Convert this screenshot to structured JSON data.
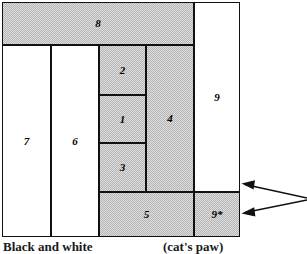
{
  "figure": {
    "type": "rectangle-packing-diagram",
    "outline": {
      "x": 2,
      "y": 2,
      "width": 238,
      "height": 235
    },
    "fill_color": "#dedede",
    "line_color": "#111111",
    "background": "#ffffff"
  },
  "rectangles": [
    {
      "id": "r8",
      "label": "8",
      "shaded": true,
      "x": 2,
      "y": 2,
      "w": 192,
      "h": 43
    },
    {
      "id": "r7",
      "label": "7",
      "shaded": false,
      "x": 2,
      "y": 45,
      "w": 49,
      "h": 192
    },
    {
      "id": "r6",
      "label": "6",
      "shaded": false,
      "x": 51,
      "y": 45,
      "w": 48,
      "h": 192
    },
    {
      "id": "r2",
      "label": "2",
      "shaded": true,
      "x": 99,
      "y": 45,
      "w": 47,
      "h": 50
    },
    {
      "id": "r1",
      "label": "1",
      "shaded": true,
      "x": 99,
      "y": 95,
      "w": 47,
      "h": 48
    },
    {
      "id": "r3",
      "label": "3",
      "shaded": true,
      "x": 99,
      "y": 143,
      "w": 47,
      "h": 49
    },
    {
      "id": "r4",
      "label": "4",
      "shaded": true,
      "x": 146,
      "y": 45,
      "w": 48,
      "h": 147
    },
    {
      "id": "r5",
      "label": "5",
      "shaded": true,
      "x": 99,
      "y": 192,
      "w": 95,
      "h": 45
    },
    {
      "id": "r9",
      "label": "9",
      "shaded": false,
      "x": 194,
      "y": 2,
      "w": 46,
      "h": 190
    },
    {
      "id": "r9s",
      "label": "9*",
      "shaded": true,
      "x": 194,
      "y": 192,
      "w": 46,
      "h": 45
    }
  ],
  "annotations": {
    "arrows": [
      {
        "id": "arrow-upper",
        "points_to": "r9",
        "tip": {
          "x": 243,
          "y": 184
        },
        "tail": {
          "x": 307,
          "y": 198
        }
      },
      {
        "id": "arrow-lower",
        "points_to": "r9s",
        "tip": {
          "x": 243,
          "y": 213
        },
        "tail": {
          "x": 307,
          "y": 200
        }
      }
    ]
  },
  "caption": {
    "left": "Black and white",
    "right": "(cat's paw)"
  }
}
